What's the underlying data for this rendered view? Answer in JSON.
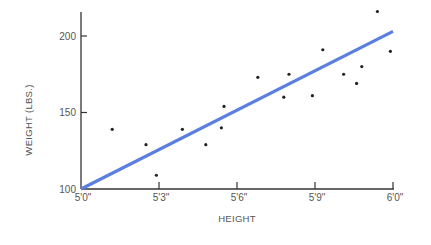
{
  "chart_data": {
    "type": "scatter",
    "title": "",
    "xlabel": "HEIGHT",
    "ylabel": "WEIGHT (LBS.)",
    "x_unit": "inches",
    "xlim": [
      60,
      72
    ],
    "ylim": [
      100,
      215
    ],
    "x_ticks": [
      {
        "value": 60,
        "label": "5'0\""
      },
      {
        "value": 63,
        "label": "5'3\""
      },
      {
        "value": 66,
        "label": "5'6\""
      },
      {
        "value": 69,
        "label": "5'9\""
      },
      {
        "value": 72,
        "label": "6'0\""
      }
    ],
    "y_ticks": [
      {
        "value": 100,
        "label": "100"
      },
      {
        "value": 150,
        "label": "150"
      },
      {
        "value": 200,
        "label": "200"
      }
    ],
    "grid": false,
    "legend": null,
    "series": [
      {
        "name": "observations",
        "type": "scatter",
        "color": "#222222",
        "points": [
          {
            "x": 61.2,
            "y": 139
          },
          {
            "x": 62.5,
            "y": 129
          },
          {
            "x": 62.9,
            "y": 109
          },
          {
            "x": 63.9,
            "y": 139
          },
          {
            "x": 64.8,
            "y": 129
          },
          {
            "x": 65.4,
            "y": 140
          },
          {
            "x": 65.5,
            "y": 154
          },
          {
            "x": 66.8,
            "y": 173
          },
          {
            "x": 67.8,
            "y": 160
          },
          {
            "x": 68.0,
            "y": 175
          },
          {
            "x": 68.9,
            "y": 161
          },
          {
            "x": 69.3,
            "y": 191
          },
          {
            "x": 70.1,
            "y": 175
          },
          {
            "x": 70.6,
            "y": 169
          },
          {
            "x": 70.8,
            "y": 180
          },
          {
            "x": 71.4,
            "y": 216
          },
          {
            "x": 71.9,
            "y": 190
          }
        ]
      },
      {
        "name": "regression line",
        "type": "line",
        "color": "#5b7fe0",
        "points": [
          {
            "x": 60,
            "y": 100
          },
          {
            "x": 72,
            "y": 203
          }
        ]
      }
    ]
  }
}
